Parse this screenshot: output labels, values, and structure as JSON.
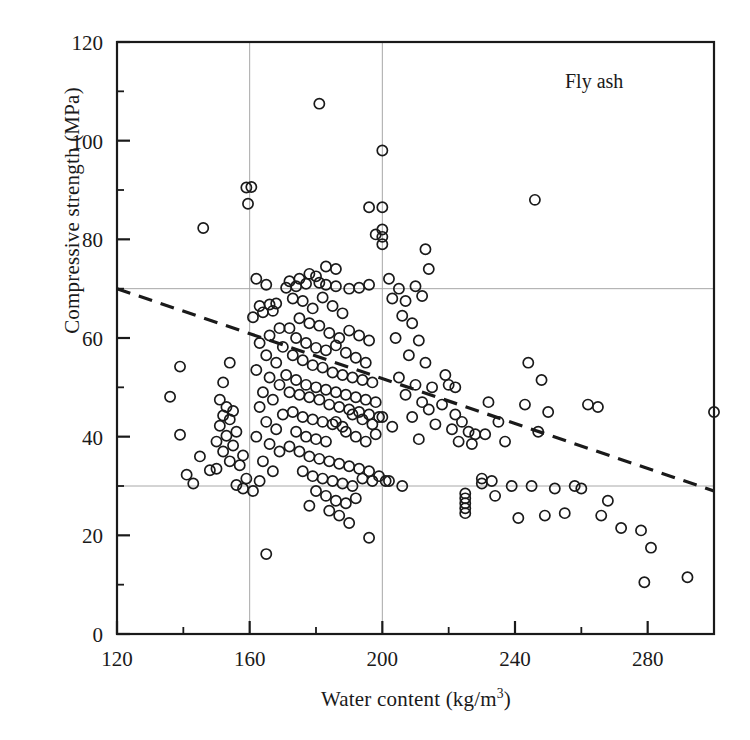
{
  "figure": {
    "panel_label": "Fly ash",
    "marker": "open-circle",
    "marker_color": "#1a1a1a",
    "background": "#ffffff"
  },
  "axes": {
    "x_title_main": "Water content (kg/m",
    "x_title_sup": "3",
    "x_title_tail": ")",
    "y_title": "Compressive strength (MPa)"
  },
  "chart_data": {
    "type": "scatter",
    "title": "",
    "annotations": [
      {
        "text": "Fly ash",
        "x": 268,
        "y": 112
      }
    ],
    "xlabel": "Water content (kg/m3)",
    "ylabel": "Compressive strength (MPa)",
    "xlim": [
      120,
      300
    ],
    "ylim": [
      0,
      120
    ],
    "xticks": [
      120,
      160,
      200,
      240,
      280
    ],
    "xticklabels": [
      "120",
      "160",
      "200",
      "240",
      "280"
    ],
    "xminorticks": [
      140,
      180,
      220,
      260,
      300
    ],
    "yticks": [
      0,
      20,
      40,
      60,
      80,
      100,
      120
    ],
    "yticklabels": [
      "0",
      "20",
      "40",
      "60",
      "80",
      "100",
      "120"
    ],
    "yminorticks": [
      10,
      30,
      50,
      70,
      90,
      110
    ],
    "grid": true,
    "gridlines_x": [
      160,
      200
    ],
    "gridlines_y": [
      30,
      70
    ],
    "legend": null,
    "trendline": {
      "style": "dashed",
      "x": [
        120,
        300
      ],
      "y": [
        70,
        29
      ]
    },
    "series": [
      {
        "name": "Fly ash concrete mixes",
        "marker": "o",
        "filled": false,
        "points": [
          [
            146,
            82.3
          ],
          [
            139,
            54.2
          ],
          [
            136,
            48.1
          ],
          [
            139,
            40.4
          ],
          [
            141,
            32.3
          ],
          [
            159,
            90.5
          ],
          [
            160.5,
            90.6
          ],
          [
            159.5,
            87.2
          ],
          [
            154,
            55.0
          ],
          [
            152,
            51.0
          ],
          [
            151,
            47.5
          ],
          [
            153,
            46.0
          ],
          [
            155,
            45.2
          ],
          [
            152,
            44.3
          ],
          [
            154,
            43.5
          ],
          [
            151,
            42.2
          ],
          [
            156,
            41.0
          ],
          [
            153,
            40.2
          ],
          [
            150,
            39.0
          ],
          [
            155,
            38.2
          ],
          [
            152,
            37.0
          ],
          [
            158,
            36.2
          ],
          [
            154,
            35.0
          ],
          [
            157,
            34.2
          ],
          [
            150,
            33.5
          ],
          [
            159,
            31.5
          ],
          [
            156,
            30.2
          ],
          [
            158,
            29.5
          ],
          [
            145,
            36.0
          ],
          [
            148,
            33.2
          ],
          [
            143,
            30.5
          ],
          [
            162,
            72.0
          ],
          [
            165,
            70.8
          ],
          [
            163,
            66.5
          ],
          [
            166,
            66.8
          ],
          [
            164,
            65.2
          ],
          [
            168,
            67.0
          ],
          [
            167,
            65.5
          ],
          [
            161,
            64.2
          ],
          [
            169,
            62.0
          ],
          [
            166,
            60.5
          ],
          [
            163,
            59.0
          ],
          [
            170,
            58.2
          ],
          [
            165,
            56.5
          ],
          [
            168,
            55.0
          ],
          [
            162,
            53.5
          ],
          [
            166,
            52.0
          ],
          [
            169,
            50.5
          ],
          [
            164,
            49.0
          ],
          [
            167,
            47.5
          ],
          [
            163,
            46.0
          ],
          [
            170,
            44.5
          ],
          [
            165,
            43.0
          ],
          [
            168,
            41.5
          ],
          [
            162,
            40.0
          ],
          [
            166,
            38.5
          ],
          [
            169,
            37.0
          ],
          [
            164,
            35.0
          ],
          [
            167,
            33.0
          ],
          [
            163,
            31.0
          ],
          [
            161,
            29.0
          ],
          [
            165,
            16.2
          ],
          [
            172,
            71.5
          ],
          [
            175,
            72.0
          ],
          [
            178,
            73.0
          ],
          [
            180,
            72.5
          ],
          [
            177,
            71.0
          ],
          [
            181,
            71.2
          ],
          [
            174,
            70.5
          ],
          [
            183,
            70.8
          ],
          [
            186,
            70.5
          ],
          [
            190,
            70.0
          ],
          [
            193,
            70.2
          ],
          [
            196,
            70.8
          ],
          [
            171,
            70.2
          ],
          [
            173,
            68.0
          ],
          [
            176,
            67.5
          ],
          [
            179,
            66.0
          ],
          [
            182,
            68.2
          ],
          [
            185,
            66.5
          ],
          [
            188,
            65.0
          ],
          [
            175,
            64.0
          ],
          [
            178,
            63.0
          ],
          [
            181,
            62.5
          ],
          [
            184,
            61.0
          ],
          [
            187,
            60.0
          ],
          [
            190,
            61.5
          ],
          [
            193,
            60.5
          ],
          [
            196,
            59.5
          ],
          [
            172,
            62.0
          ],
          [
            174,
            60.0
          ],
          [
            177,
            59.0
          ],
          [
            180,
            58.0
          ],
          [
            183,
            57.5
          ],
          [
            186,
            58.5
          ],
          [
            189,
            57.0
          ],
          [
            192,
            56.0
          ],
          [
            195,
            55.0
          ],
          [
            173,
            56.5
          ],
          [
            176,
            55.5
          ],
          [
            179,
            54.5
          ],
          [
            182,
            54.0
          ],
          [
            185,
            53.0
          ],
          [
            188,
            52.5
          ],
          [
            191,
            52.0
          ],
          [
            194,
            51.5
          ],
          [
            197,
            51.0
          ],
          [
            171,
            52.5
          ],
          [
            174,
            51.5
          ],
          [
            177,
            50.5
          ],
          [
            180,
            50.0
          ],
          [
            183,
            49.5
          ],
          [
            186,
            49.0
          ],
          [
            189,
            48.5
          ],
          [
            192,
            48.0
          ],
          [
            195,
            47.5
          ],
          [
            198,
            47.0
          ],
          [
            172,
            49.0
          ],
          [
            175,
            48.5
          ],
          [
            178,
            48.0
          ],
          [
            181,
            47.5
          ],
          [
            184,
            46.5
          ],
          [
            187,
            46.0
          ],
          [
            190,
            45.5
          ],
          [
            193,
            45.0
          ],
          [
            196,
            44.5
          ],
          [
            199,
            44.0
          ],
          [
            173,
            45.0
          ],
          [
            176,
            44.0
          ],
          [
            179,
            43.5
          ],
          [
            182,
            43.0
          ],
          [
            185,
            42.5
          ],
          [
            188,
            42.0
          ],
          [
            191,
            44.5
          ],
          [
            194,
            43.5
          ],
          [
            197,
            42.5
          ],
          [
            200,
            44.0
          ],
          [
            174,
            41.0
          ],
          [
            177,
            40.0
          ],
          [
            180,
            39.5
          ],
          [
            183,
            39.0
          ],
          [
            186,
            43.0
          ],
          [
            189,
            41.0
          ],
          [
            192,
            40.0
          ],
          [
            195,
            39.0
          ],
          [
            198,
            40.5
          ],
          [
            172,
            38.0
          ],
          [
            175,
            37.0
          ],
          [
            178,
            36.0
          ],
          [
            181,
            35.5
          ],
          [
            184,
            35.0
          ],
          [
            187,
            34.5
          ],
          [
            190,
            34.0
          ],
          [
            193,
            33.5
          ],
          [
            196,
            33.0
          ],
          [
            199,
            32.0
          ],
          [
            176,
            33.0
          ],
          [
            179,
            32.0
          ],
          [
            182,
            31.5
          ],
          [
            185,
            31.0
          ],
          [
            188,
            30.5
          ],
          [
            191,
            30.0
          ],
          [
            194,
            31.5
          ],
          [
            197,
            31.0
          ],
          [
            201,
            31.0
          ],
          [
            180,
            29.0
          ],
          [
            183,
            28.0
          ],
          [
            186,
            27.0
          ],
          [
            189,
            26.5
          ],
          [
            192,
            27.5
          ],
          [
            178,
            26.0
          ],
          [
            184,
            25.0
          ],
          [
            187,
            24.0
          ],
          [
            190,
            22.5
          ],
          [
            196,
            19.5
          ],
          [
            181,
            107.5
          ],
          [
            200,
            98.0
          ],
          [
            200,
            86.5
          ],
          [
            200,
            82.0
          ],
          [
            200,
            80.5
          ],
          [
            200,
            79.0
          ],
          [
            198,
            81.0
          ],
          [
            196,
            86.5
          ],
          [
            186,
            74.0
          ],
          [
            183,
            74.5
          ],
          [
            202,
            72.0
          ],
          [
            205,
            70.0
          ],
          [
            207,
            67.5
          ],
          [
            203,
            68.0
          ],
          [
            206,
            64.5
          ],
          [
            209,
            63.0
          ],
          [
            204,
            60.0
          ],
          [
            211,
            59.5
          ],
          [
            208,
            56.5
          ],
          [
            213,
            55.0
          ],
          [
            205,
            52.0
          ],
          [
            210,
            50.5
          ],
          [
            215,
            50.0
          ],
          [
            207,
            48.5
          ],
          [
            212,
            47.0
          ],
          [
            218,
            46.5
          ],
          [
            209,
            44.0
          ],
          [
            214,
            45.5
          ],
          [
            203,
            42.0
          ],
          [
            216,
            42.5
          ],
          [
            211,
            39.5
          ],
          [
            220,
            50.5
          ],
          [
            222,
            50.0
          ],
          [
            219,
            52.5
          ],
          [
            202,
            31.0
          ],
          [
            206,
            30.0
          ],
          [
            213,
            78.0
          ],
          [
            214,
            74.0
          ],
          [
            210,
            70.5
          ],
          [
            212,
            68.5
          ],
          [
            222,
            44.5
          ],
          [
            224,
            43.0
          ],
          [
            226,
            41.0
          ],
          [
            228,
            40.5
          ],
          [
            221,
            41.5
          ],
          [
            223,
            39.0
          ],
          [
            227,
            38.5
          ],
          [
            225,
            28.5
          ],
          [
            225,
            27.5
          ],
          [
            225,
            26.5
          ],
          [
            225,
            25.5
          ],
          [
            225,
            24.5
          ],
          [
            232,
            47.0
          ],
          [
            235,
            43.0
          ],
          [
            231,
            40.5
          ],
          [
            237,
            39.0
          ],
          [
            233,
            31.0
          ],
          [
            230,
            30.5
          ],
          [
            239,
            30.0
          ],
          [
            246,
            88.0
          ],
          [
            244,
            55.0
          ],
          [
            248,
            51.5
          ],
          [
            243,
            46.5
          ],
          [
            250,
            45.0
          ],
          [
            247,
            41.0
          ],
          [
            245,
            30.0
          ],
          [
            252,
            29.5
          ],
          [
            249,
            24.0
          ],
          [
            255,
            24.5
          ],
          [
            258,
            30.0
          ],
          [
            262,
            46.5
          ],
          [
            265,
            46.0
          ],
          [
            260,
            29.5
          ],
          [
            268,
            27.0
          ],
          [
            272,
            21.5
          ],
          [
            278,
            21.0
          ],
          [
            281,
            17.5
          ],
          [
            279,
            10.5
          ],
          [
            292,
            11.5
          ],
          [
            300,
            45.0
          ],
          [
            230,
            31.5
          ],
          [
            234,
            28.0
          ],
          [
            241,
            23.5
          ],
          [
            266,
            24.0
          ]
        ]
      }
    ]
  }
}
